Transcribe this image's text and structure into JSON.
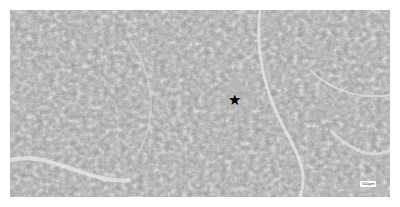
{
  "figure": {
    "type": "histology-micrograph",
    "marker": {
      "symbol": "★",
      "x": 235,
      "y": 99,
      "color": "#000000"
    },
    "scale_bar": {
      "label": "100μm",
      "x": 360,
      "y": 181
    }
  },
  "colors": {
    "tissue_dark": "#6e6e6e",
    "tissue_mid": "#9a9a9a",
    "background_light": "#e8e8e8"
  }
}
